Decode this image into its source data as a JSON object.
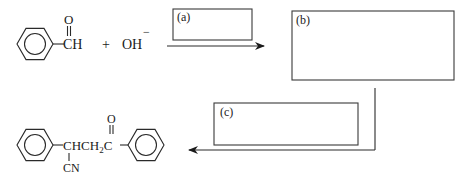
{
  "diagram": {
    "type": "reaction-scheme",
    "reactants": {
      "benzaldehyde": {
        "carbonyl_atom": "O",
        "group": "CH"
      },
      "plus": "+",
      "hydroxide": {
        "formula": "OH",
        "charge": "−"
      }
    },
    "boxes": [
      {
        "id": "a",
        "label": "(a)",
        "content": ""
      },
      {
        "id": "b",
        "label": "(b)",
        "content": ""
      },
      {
        "id": "c",
        "label": "(c)",
        "content": ""
      }
    ],
    "product": {
      "chain_main": "CHCH",
      "chain_sub": "2",
      "carbonyl_c": "C",
      "carbonyl_o": "O",
      "substituent": "CN"
    },
    "arrows": [
      {
        "from": "reactants",
        "to": "b",
        "direction": "right",
        "box": "a"
      },
      {
        "from": "b",
        "to": "product",
        "direction": "down-then-left",
        "box": "c"
      }
    ]
  }
}
